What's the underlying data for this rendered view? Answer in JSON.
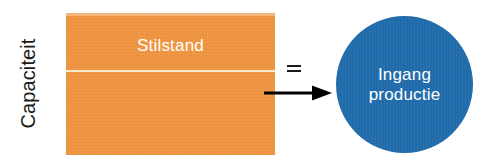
{
  "diagram": {
    "background_color": "#ffffff",
    "axis_label": "Capaciteit",
    "capacity_block": {
      "top_segment_label": "Stilstand",
      "color": "#ef9440",
      "divider_color": "#fbe7c9"
    },
    "operator": "=",
    "arrow": {
      "direction": "right",
      "color": "#000000"
    },
    "output_node": {
      "line1": "Ingang",
      "line2": "productie",
      "color": "#206cac",
      "shape": "circle"
    }
  }
}
